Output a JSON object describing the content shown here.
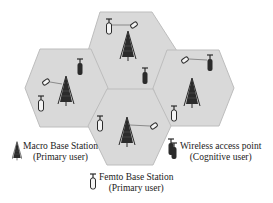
{
  "diagram": {
    "title": "",
    "cells": [
      {
        "id": "top",
        "center": [
          126,
          51
        ]
      },
      {
        "id": "left",
        "center": [
          66,
          88
        ]
      },
      {
        "id": "right",
        "center": [
          193,
          88
        ]
      },
      {
        "id": "bottom",
        "center": [
          130,
          126
        ]
      }
    ],
    "colors": {
      "cell_fill": "#d9d9d9",
      "cell_stroke": "#bdbdbd",
      "icon": "#2b2b2b",
      "background": "#ffffff"
    }
  },
  "legend": {
    "macro": {
      "line1": "Macro Base Station",
      "line2": "(Primary user)"
    },
    "wireless": {
      "line1": "Wireless access point",
      "line2": "(Cognitive user)"
    },
    "femto": {
      "line1": "Femto Base Station",
      "line2": "(Primary user)"
    }
  }
}
